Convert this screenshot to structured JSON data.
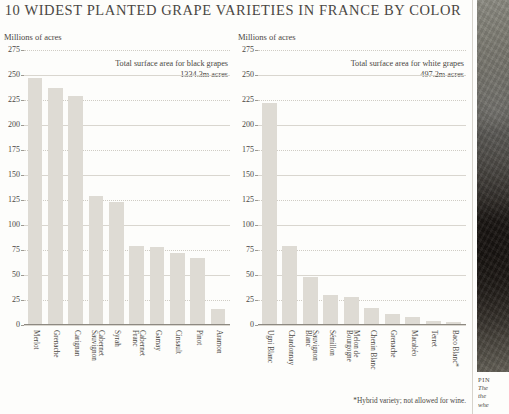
{
  "title": "10 WIDEST PLANTED GRAPE VARIETIES IN FRANCE BY COLOR",
  "footnote": "*Hybrid variety; not allowed for wine.",
  "photo": {
    "name": "pinot-noir-photo",
    "caption_title": "PIN",
    "caption_line1": "The",
    "caption_line2": "the ",
    "caption_line3": "whe"
  },
  "panels": {
    "black": {
      "unit_label": "Millions of acres",
      "annotation_line1": "Total surface area for black grapes",
      "annotation_line2": "1334.3m acres"
    },
    "white": {
      "unit_label": "Millions of acres",
      "annotation_line1": "Total surface area for white grapes",
      "annotation_line2": "497.2m acres"
    }
  },
  "chart_data": [
    {
      "type": "bar",
      "id": "black-grapes",
      "title": "Total surface area for black grapes",
      "subtitle": "1334.3m acres",
      "xlabel": "",
      "ylabel": "Millions of acres",
      "ylim": [
        0,
        275
      ],
      "yticks": [
        0,
        25,
        50,
        75,
        100,
        125,
        150,
        175,
        200,
        225,
        250,
        275
      ],
      "grid": true,
      "legend": "none",
      "bar_color": "#dedbd4",
      "categories": [
        "Merlot",
        "Grenache",
        "Carignan",
        "Cabernet Sauvignon",
        "Syrah",
        "Cabernet Franc",
        "Gamay",
        "Cinsault",
        "Pinot",
        "Aramon"
      ],
      "values": [
        247,
        237,
        229,
        129,
        123,
        79,
        78,
        72,
        67,
        16
      ]
    },
    {
      "type": "bar",
      "id": "white-grapes",
      "title": "Total surface area for white grapes",
      "subtitle": "497.2m acres",
      "xlabel": "",
      "ylabel": "Millions of acres",
      "ylim": [
        0,
        275
      ],
      "yticks": [
        0,
        25,
        50,
        75,
        100,
        125,
        150,
        175,
        200,
        225,
        250,
        275
      ],
      "grid": true,
      "legend": "none",
      "bar_color": "#dedbd4",
      "categories": [
        "Ugni Blanc",
        "Chardonnay",
        "Sauvignon Blanc",
        "Sémillon",
        "Melon de Bourgogne",
        "Chenin Blanc",
        "Grenache",
        "Macabéo",
        "Terret",
        "Baco Blanc*"
      ],
      "values": [
        222,
        79,
        48,
        30,
        28,
        17,
        11,
        8,
        4,
        3
      ]
    }
  ],
  "category_lines": {
    "black": [
      [
        "Merlot",
        ""
      ],
      [
        "Grenache",
        ""
      ],
      [
        "Carignan",
        ""
      ],
      [
        "Cabernet",
        "Sauvignon"
      ],
      [
        "Syrah",
        ""
      ],
      [
        "Cabernet",
        "Franc"
      ],
      [
        "Gamay",
        ""
      ],
      [
        "Cinsault",
        ""
      ],
      [
        "Pinot",
        ""
      ],
      [
        "Aramon",
        ""
      ]
    ],
    "white": [
      [
        "Ugni Blanc",
        ""
      ],
      [
        "Chardonnay",
        ""
      ],
      [
        "Sauvignon",
        "Blanc"
      ],
      [
        "Sémillon",
        ""
      ],
      [
        "Melon de",
        "Bourgogne"
      ],
      [
        "Chenin Blanc",
        ""
      ],
      [
        "Grenache",
        ""
      ],
      [
        "Macabéo",
        ""
      ],
      [
        "Terret",
        ""
      ],
      [
        "Baco Blanc*",
        ""
      ]
    ]
  }
}
